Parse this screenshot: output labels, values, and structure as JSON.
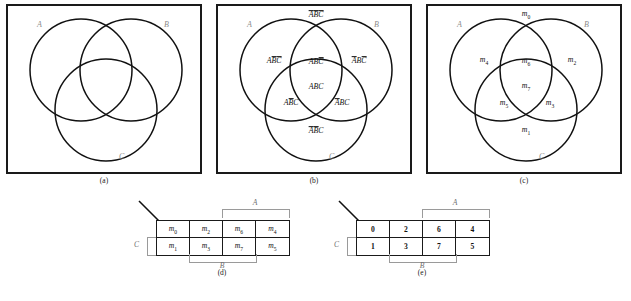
{
  "figure": {
    "panels": [
      {
        "id": "a",
        "caption": "(a)",
        "set_labels": [
          "A",
          "B",
          "C"
        ],
        "regions": []
      },
      {
        "id": "b",
        "caption": "(b)",
        "set_labels": [
          "A",
          "B",
          "C"
        ],
        "regions": [
          {
            "name": "outside-all",
            "parts": [
              {
                "t": "A",
                "bar": true
              },
              {
                "t": "B",
                "bar": true
              },
              {
                "t": "C",
                "bar": true
              }
            ]
          },
          {
            "name": "A-only",
            "parts": [
              {
                "t": "A",
                "bar": false
              },
              {
                "t": "B",
                "bar": true
              },
              {
                "t": "C",
                "bar": true
              }
            ]
          },
          {
            "name": "A-and-B-only",
            "parts": [
              {
                "t": "A",
                "bar": false
              },
              {
                "t": "B",
                "bar": false
              },
              {
                "t": "C",
                "bar": true
              }
            ]
          },
          {
            "name": "B-only",
            "parts": [
              {
                "t": "A",
                "bar": true
              },
              {
                "t": "B",
                "bar": false
              },
              {
                "t": "C",
                "bar": true
              }
            ]
          },
          {
            "name": "A-and-B-and-C",
            "parts": [
              {
                "t": "A",
                "bar": false
              },
              {
                "t": "B",
                "bar": false
              },
              {
                "t": "C",
                "bar": false
              }
            ]
          },
          {
            "name": "A-and-C-only",
            "parts": [
              {
                "t": "A",
                "bar": false
              },
              {
                "t": "B",
                "bar": true
              },
              {
                "t": "C",
                "bar": false
              }
            ]
          },
          {
            "name": "B-and-C-only",
            "parts": [
              {
                "t": "A",
                "bar": true
              },
              {
                "t": "B",
                "bar": false
              },
              {
                "t": "C",
                "bar": false
              }
            ]
          },
          {
            "name": "C-only",
            "parts": [
              {
                "t": "A",
                "bar": true
              },
              {
                "t": "B",
                "bar": true
              },
              {
                "t": "C",
                "bar": false
              }
            ]
          }
        ]
      },
      {
        "id": "c",
        "caption": "(c)",
        "set_labels": [
          "A",
          "B",
          "C"
        ],
        "minterms": {
          "outside-all": "0",
          "A-only": "4",
          "A-and-B-only": "6",
          "B-only": "2",
          "A-and-B-and-C": "7",
          "A-and-C-only": "5",
          "B-and-C-only": "3",
          "C-only": "1"
        }
      }
    ],
    "kmaps": [
      {
        "id": "d",
        "caption": "(d)",
        "top_label": "A",
        "bottom_label": "B",
        "left_label": "C",
        "symbol": "m",
        "rows": [
          [
            "0",
            "2",
            "6",
            "4"
          ],
          [
            "1",
            "3",
            "7",
            "5"
          ]
        ]
      },
      {
        "id": "e",
        "caption": "(e)",
        "top_label": "A",
        "bottom_label": "B",
        "left_label": "C",
        "symbol": "",
        "rows": [
          [
            "0",
            "2",
            "6",
            "4"
          ],
          [
            "1",
            "3",
            "7",
            "5"
          ]
        ]
      }
    ]
  }
}
